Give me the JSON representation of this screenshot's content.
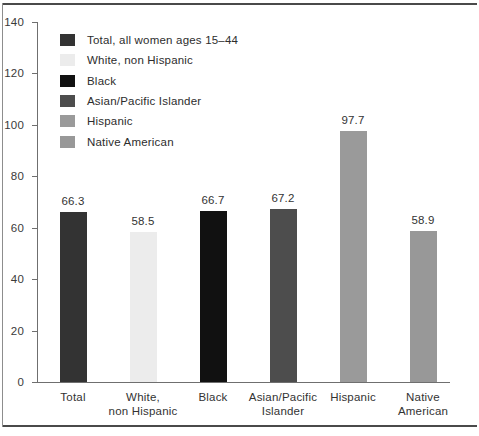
{
  "chart_data": {
    "type": "bar",
    "title": "",
    "subtitle": "",
    "xlabel": "",
    "ylabel": "",
    "ylim": [
      0,
      140
    ],
    "y_ticks": [
      "0",
      "20",
      "40",
      "60",
      "80",
      "100",
      "120",
      "140"
    ],
    "grid": false,
    "legend_position": "inside-top-left",
    "categories": [
      "Total",
      "White,\nnon Hispanic",
      "Black",
      "Asian/Pacific\nIslander",
      "Hispanic",
      "Native\nAmerican"
    ],
    "values": [
      66.3,
      58.5,
      66.7,
      67.2,
      97.7,
      58.9
    ],
    "value_labels": [
      "66.3",
      "58.5",
      "66.7",
      "67.2",
      "97.7",
      "58.9"
    ],
    "bar_colors": [
      "#333333",
      "#ececec",
      "#111111",
      "#4d4d4d",
      "#9a9a9a",
      "#989898"
    ],
    "legend": [
      {
        "label": "Total, all women ages 15–44",
        "color": "#333333"
      },
      {
        "label": "White, non Hispanic",
        "color": "#ececec"
      },
      {
        "label": "Black",
        "color": "#111111"
      },
      {
        "label": "Asian/Pacific Islander",
        "color": "#4d4d4d"
      },
      {
        "label": "Hispanic",
        "color": "#9a9a9a"
      },
      {
        "label": "Native American",
        "color": "#989898"
      }
    ]
  },
  "axis": {
    "axis_color": "#6f6f6f",
    "frame_color": "#4a4a4a"
  }
}
